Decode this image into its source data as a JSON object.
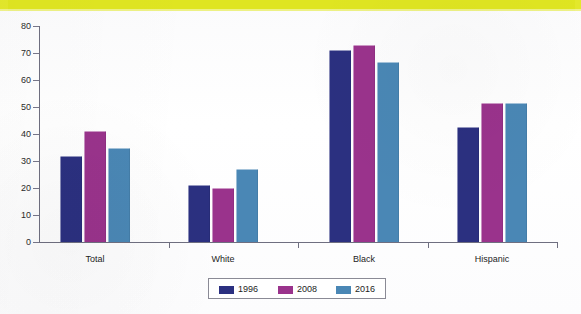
{
  "banner": {
    "color": "#e3e82b",
    "ghost_text": ""
  },
  "chart_data": {
    "type": "bar",
    "title": "",
    "subtitle": "",
    "xlabel": "",
    "ylabel": "",
    "categories": [
      "Total",
      "White",
      "Black",
      "Hispanic"
    ],
    "series": [
      {
        "name": "1996",
        "color": "#2b3080",
        "values": [
          32,
          21,
          71,
          42.5
        ]
      },
      {
        "name": "2008",
        "color": "#9a338c",
        "values": [
          41,
          20,
          73,
          51.5
        ]
      },
      {
        "name": "2016",
        "color": "#4a87b5",
        "values": [
          35,
          27,
          66.5,
          51.5
        ]
      }
    ],
    "ylim": [
      0,
      80
    ],
    "yticks": [
      0,
      10,
      20,
      30,
      40,
      50,
      60,
      70,
      80
    ],
    "ytick_labels": [
      "0",
      "10",
      "20",
      "30",
      "40",
      "50",
      "60",
      "70",
      "80"
    ],
    "grid": false,
    "legend_position": "bottom-center",
    "legend_entries": [
      "1996",
      "2008",
      "2016"
    ]
  },
  "legend": {
    "items": [
      {
        "label": "1996",
        "color": "#2b3080"
      },
      {
        "label": "2008",
        "color": "#9a338c"
      },
      {
        "label": "2016",
        "color": "#4a87b5"
      }
    ]
  }
}
